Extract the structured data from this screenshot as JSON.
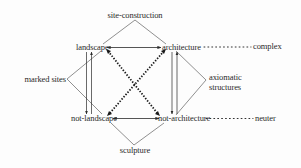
{
  "diagram": {
    "nodes": {
      "site_construction": "site-construction",
      "landscape": "landscape",
      "architecture": "architecture",
      "complex": "complex",
      "marked_sites": "marked sites",
      "axiomatic_line1": "axiomatic",
      "axiomatic_line2": "structures",
      "not_landscape": "not-landscape",
      "not_architecture": "not-architecture",
      "neuter": "neuter",
      "sculpture": "sculpture"
    },
    "edges": [
      {
        "from": "landscape",
        "to": "architecture",
        "style": "solid",
        "arrows": "both"
      },
      {
        "from": "not-landscape",
        "to": "not-architecture",
        "style": "solid",
        "arrows": "both"
      },
      {
        "from": "landscape",
        "to": "not-landscape",
        "style": "solid",
        "arrows": "double-vertical"
      },
      {
        "from": "architecture",
        "to": "not-architecture",
        "style": "solid",
        "arrows": "double-vertical"
      },
      {
        "from": "landscape",
        "to": "not-architecture",
        "style": "heavy-dotted",
        "arrows": "both"
      },
      {
        "from": "architecture",
        "to": "not-landscape",
        "style": "heavy-dotted",
        "arrows": "both"
      },
      {
        "from": "site-construction",
        "to": "landscape",
        "style": "thin"
      },
      {
        "from": "site-construction",
        "to": "architecture",
        "style": "thin"
      },
      {
        "from": "marked sites",
        "to": "landscape",
        "style": "thin"
      },
      {
        "from": "marked sites",
        "to": "not-landscape",
        "style": "thin"
      },
      {
        "from": "axiomatic structures",
        "to": "architecture",
        "style": "thin"
      },
      {
        "from": "axiomatic structures",
        "to": "not-architecture",
        "style": "thin"
      },
      {
        "from": "sculpture",
        "to": "not-landscape",
        "style": "thin"
      },
      {
        "from": "sculpture",
        "to": "not-architecture",
        "style": "thin"
      },
      {
        "from": "architecture",
        "to": "complex",
        "style": "dotted-leader"
      },
      {
        "from": "not-architecture",
        "to": "neuter",
        "style": "dotted-leader"
      }
    ],
    "colors": {
      "background": "#fdfdfd",
      "ink": "#2a2a2a"
    }
  }
}
